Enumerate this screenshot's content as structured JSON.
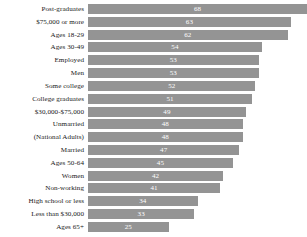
{
  "chart_data": {
    "type": "bar",
    "orientation": "horizontal",
    "title": "",
    "subtitle": "",
    "xlabel": "",
    "ylabel": "",
    "xlim": [
      0,
      68
    ],
    "grid": false,
    "legend": "none",
    "bar_color": "#949494",
    "value_label_color": "#ffffff",
    "background_color": "#ffffff",
    "categories": [
      "Post-graduates",
      "$75,000 or more",
      "Ages 18-29",
      "Ages 30-49",
      "Employed",
      "Men",
      "Some college",
      "College graduates",
      "$30,000-$75,000",
      "Unmarried",
      "(National Adults)",
      "Married",
      "Ages 50-64",
      "Women",
      "Non-working",
      "High school or less",
      "Less than $30,000",
      "Ages 65+"
    ],
    "values": [
      68,
      63,
      62,
      54,
      53,
      53,
      52,
      51,
      49,
      48,
      48,
      47,
      45,
      42,
      41,
      34,
      33,
      25
    ]
  }
}
